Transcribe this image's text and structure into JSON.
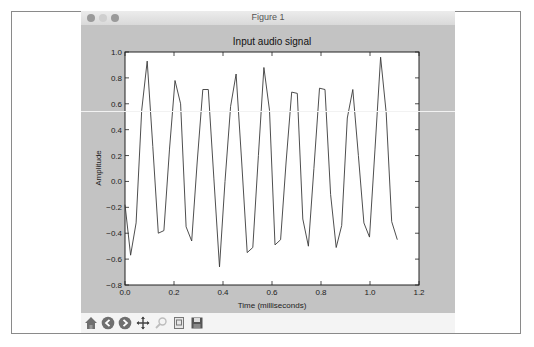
{
  "window": {
    "title": "Figure 1",
    "controls": [
      "close",
      "minimize",
      "zoom"
    ]
  },
  "toolbar": {
    "buttons": [
      {
        "name": "home",
        "icon": "home-icon"
      },
      {
        "name": "back",
        "icon": "arrow-left-icon"
      },
      {
        "name": "forward",
        "icon": "arrow-right-icon"
      },
      {
        "name": "pan",
        "icon": "pan-move-icon"
      },
      {
        "name": "zoom",
        "icon": "zoom-rect-icon"
      },
      {
        "name": "configure-subplots",
        "icon": "subplots-icon"
      },
      {
        "name": "save",
        "icon": "save-disk-icon"
      }
    ]
  },
  "colors": {
    "figure_bg": "#c3c3c3",
    "axes_bg": "#ffffff",
    "line": "#3a3a3a"
  },
  "chart_data": {
    "type": "line",
    "title": "Input audio signal",
    "xlabel": "Time (milliseconds)",
    "ylabel": "Amplitude",
    "xlim": [
      0.0,
      1.2
    ],
    "ylim": [
      -0.8,
      1.0
    ],
    "xticks": [
      "0.0",
      "0.2",
      "0.4",
      "0.6",
      "0.8",
      "1.0",
      "1.2"
    ],
    "yticks": [
      "1.0",
      "0.8",
      "0.6",
      "0.4",
      "0.2",
      "0.0",
      "-0.2",
      "-0.4",
      "-0.6",
      "-0.8"
    ],
    "grid": false,
    "legend": null,
    "sample_interval_ms": 0.02268,
    "series": [
      {
        "name": "signal",
        "values": [
          -0.18,
          -0.57,
          -0.32,
          0.55,
          0.93,
          0.27,
          -0.4,
          -0.38,
          0.25,
          0.78,
          0.6,
          -0.35,
          -0.46,
          0.15,
          0.71,
          0.71,
          0.02,
          -0.66,
          0.0,
          0.58,
          0.83,
          0.15,
          -0.55,
          -0.51,
          0.2,
          0.88,
          0.55,
          -0.49,
          -0.45,
          0.15,
          0.69,
          0.68,
          -0.29,
          -0.5,
          0.1,
          0.72,
          0.71,
          -0.1,
          -0.51,
          -0.34,
          0.49,
          0.71,
          0.2,
          -0.32,
          -0.43,
          0.25,
          0.96,
          0.53,
          -0.31,
          -0.45
        ]
      }
    ]
  }
}
